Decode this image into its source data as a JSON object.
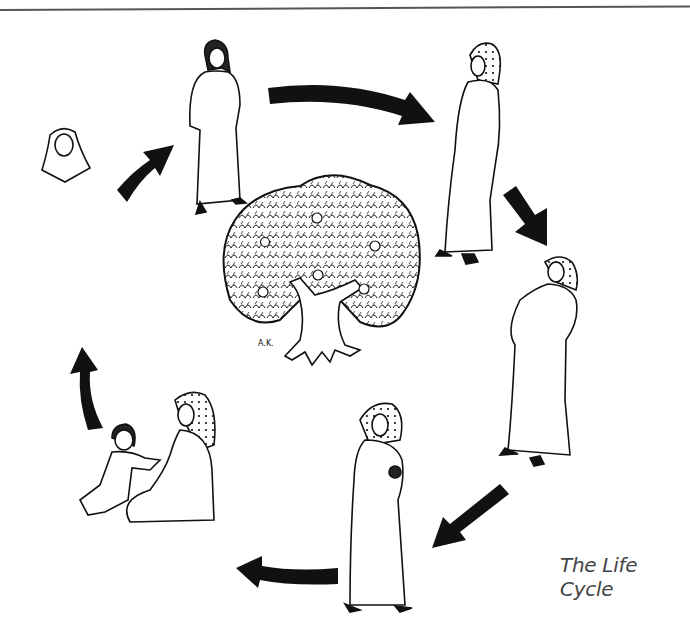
{
  "diagram": {
    "caption": "The Life Cycle",
    "signature": "A.K.",
    "center": {
      "name": "apple-tree",
      "label": "Tree of life with apples"
    },
    "stages": [
      {
        "id": 1,
        "label": "Young girl",
        "position": "top"
      },
      {
        "id": 2,
        "label": "Young woman in headscarf",
        "position": "top-right"
      },
      {
        "id": 3,
        "label": "Pregnant woman",
        "position": "right"
      },
      {
        "id": 4,
        "label": "Mother holding newborn",
        "position": "bottom"
      },
      {
        "id": 5,
        "label": "Mother with toddler",
        "position": "bottom-left"
      },
      {
        "id": 6,
        "label": "Elder woman with girl",
        "position": "left"
      }
    ],
    "arrows": [
      {
        "from": 1,
        "to": 2,
        "direction": "clockwise"
      },
      {
        "from": 2,
        "to": 3,
        "direction": "clockwise"
      },
      {
        "from": 3,
        "to": 4,
        "direction": "clockwise"
      },
      {
        "from": 4,
        "to": 5,
        "direction": "clockwise"
      },
      {
        "from": 5,
        "to": 6,
        "direction": "clockwise"
      },
      {
        "from": 6,
        "to": 1,
        "direction": "clockwise"
      }
    ],
    "colors": {
      "ink": "#111111",
      "background": "#ffffff",
      "caption": "#444444"
    }
  }
}
